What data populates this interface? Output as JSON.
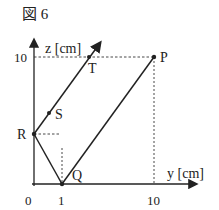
{
  "figure": {
    "title": "図 6"
  },
  "axes": {
    "vertical_label": "z [cm]",
    "horizontal_label": "y [cm]",
    "origin_label": "0",
    "horizontal_ticks": [
      "1",
      "10"
    ],
    "vertical_ticks": [
      "10"
    ]
  },
  "points": {
    "P": {
      "label": "P",
      "y": 10,
      "z": 10
    },
    "Q": {
      "label": "Q",
      "y": 1,
      "z": 0
    },
    "R": {
      "label": "R",
      "y": 0,
      "z": 3.5
    },
    "S": {
      "label": "S",
      "y": 1,
      "z": 5
    },
    "T": {
      "label": "T",
      "y": 4,
      "z": 10
    }
  },
  "colors": {
    "line": "#222222",
    "background": "#ffffff"
  }
}
